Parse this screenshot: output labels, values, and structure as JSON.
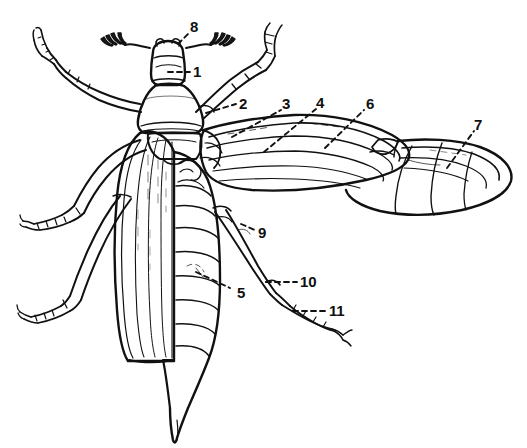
{
  "figure": {
    "kind": "scientific-line-drawing",
    "background_color": "#ffffff",
    "ink_color": "#111111",
    "width": 527,
    "height": 448
  },
  "callouts": [
    {
      "id": "1",
      "text": "1",
      "x": 193,
      "y": 64,
      "leader": {
        "type": "dashed",
        "x1": 168,
        "y1": 72,
        "x2": 190,
        "y2": 72
      }
    },
    {
      "id": "2",
      "text": "2",
      "x": 239,
      "y": 96,
      "leader": {
        "type": "dashed",
        "x1": 206,
        "y1": 113,
        "x2": 236,
        "y2": 104
      }
    },
    {
      "id": "3",
      "text": "3",
      "x": 282,
      "y": 96,
      "leader": {
        "type": "dashed",
        "x1": 232,
        "y1": 137,
        "x2": 281,
        "y2": 110
      }
    },
    {
      "id": "4",
      "text": "4",
      "x": 316,
      "y": 95,
      "leader": {
        "type": "dashed",
        "x1": 264,
        "y1": 152,
        "x2": 316,
        "y2": 109
      }
    },
    {
      "id": "5",
      "text": "5",
      "x": 237,
      "y": 285,
      "leader": {
        "type": "dashed",
        "x1": 196,
        "y1": 272,
        "x2": 230,
        "y2": 288
      }
    },
    {
      "id": "6",
      "text": "6",
      "x": 366,
      "y": 96,
      "leader": {
        "type": "dashed",
        "x1": 325,
        "y1": 148,
        "x2": 364,
        "y2": 110
      }
    },
    {
      "id": "7",
      "text": "7",
      "x": 474,
      "y": 117,
      "leader": {
        "type": "dashed",
        "x1": 447,
        "y1": 168,
        "x2": 474,
        "y2": 131
      }
    },
    {
      "id": "8",
      "text": "8",
      "x": 190,
      "y": 19,
      "leader": {
        "type": "dashed",
        "x1": 178,
        "y1": 44,
        "x2": 190,
        "y2": 32
      }
    },
    {
      "id": "9",
      "text": "9",
      "x": 258,
      "y": 225,
      "leader": {
        "type": "dashed",
        "x1": 241,
        "y1": 224,
        "x2": 255,
        "y2": 230
      }
    },
    {
      "id": "10",
      "text": "10",
      "x": 300,
      "y": 274,
      "leader": {
        "type": "dashed",
        "x1": 266,
        "y1": 282,
        "x2": 297,
        "y2": 282
      }
    },
    {
      "id": "11",
      "text": "11",
      "x": 329,
      "y": 303,
      "leader": {
        "type": "dashed",
        "x1": 293,
        "y1": 311,
        "x2": 326,
        "y2": 311
      }
    }
  ],
  "parts": {
    "head": "head-with-lamellate-antennae",
    "pronotum": "pronotum",
    "elytron": "left-elytron-wing-cover",
    "abdomen": "segmented-abdomen-with-pointed-pygidium",
    "right_elytron": "right-elytron-raised",
    "hindwing": "membranous-hindwing-unfolded",
    "legs": "three-pairs-of-legs"
  }
}
